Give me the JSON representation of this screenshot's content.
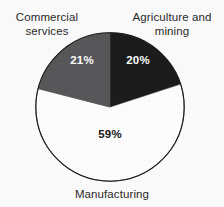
{
  "chart_data": {
    "type": "pie",
    "title": "",
    "legend_position": "around-slices",
    "categories": [
      "Agriculture and mining",
      "Manufacturing",
      "Commercial services"
    ],
    "values": [
      20,
      59,
      21
    ],
    "value_labels": [
      "20%",
      "59%",
      "21%"
    ],
    "colors": [
      "#1c1c1c",
      "#ffffff",
      "#58585a"
    ],
    "label_text_colors": [
      "#ffffff",
      "#1a1a1a",
      "#ffffff"
    ],
    "start_angle_deg": 0,
    "direction": "clockwise",
    "outline_color": "#1a1a1a",
    "xlabel": "",
    "ylabel": ""
  },
  "labels": {
    "commercial": {
      "line1": "Commercial",
      "line2": "services"
    },
    "agriculture": {
      "line1": "Agriculture and",
      "line2": "mining"
    },
    "manufacturing": "Manufacturing"
  }
}
